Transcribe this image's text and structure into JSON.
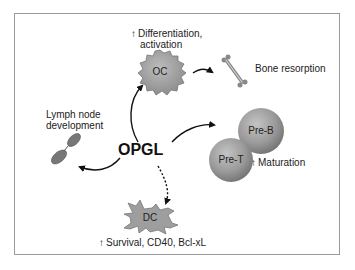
{
  "diagram": {
    "center": {
      "label": "OPGL"
    },
    "nodes": {
      "oc": {
        "label": "OC",
        "effect_arrow": "↑",
        "effect": "Differentiation,",
        "effect2": "activation"
      },
      "bone": {
        "label": "Bone resorption"
      },
      "lymph": {
        "label_line1": "Lymph node",
        "label_line2": "development"
      },
      "pre_b": {
        "label": "Pre-B"
      },
      "pre_t": {
        "label": "Pre-T"
      },
      "maturation": {
        "arrow": "↑",
        "label": "Maturation"
      },
      "dc": {
        "label": "DC",
        "effect_arrow": "↑",
        "effect": "Survival, CD40, Bcl-xL"
      }
    },
    "edges": [
      {
        "from": "OPGL",
        "to": "OC",
        "style": "solid"
      },
      {
        "from": "OC",
        "to": "Bone resorption",
        "style": "solid"
      },
      {
        "from": "OPGL",
        "to": "Lymph node",
        "style": "solid"
      },
      {
        "from": "OPGL",
        "to": "Pre-B/Pre-T",
        "style": "solid"
      },
      {
        "from": "OPGL",
        "to": "DC",
        "style": "dashed"
      }
    ],
    "colors": {
      "cell_fill": "#9e9e9e",
      "cell_dark": "#6f6f6f",
      "border": "#9a9a9a",
      "text": "#222222"
    }
  }
}
